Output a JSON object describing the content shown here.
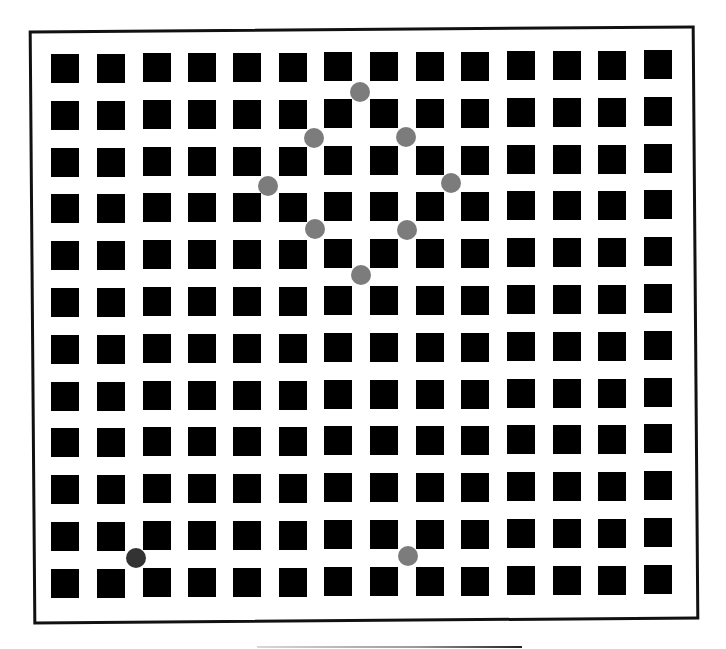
{
  "figure": {
    "grid": {
      "columns": 14,
      "rows": 12,
      "square_color": "#000000",
      "background_color": "#ffffff",
      "col_x": [
        51,
        97,
        143,
        188,
        233,
        279,
        324,
        370,
        416,
        461,
        507,
        553,
        598,
        644
      ],
      "row_y": [
        54,
        101,
        148,
        194,
        241,
        288,
        335,
        382,
        428,
        475,
        522,
        569
      ]
    },
    "frame": {
      "border_color": "#111111"
    },
    "circles": [
      {
        "x": 360,
        "y": 92,
        "color": "#7c7c7c",
        "label": "diamond-top"
      },
      {
        "x": 314,
        "y": 138,
        "color": "#7c7c7c",
        "label": "diamond-upper-left"
      },
      {
        "x": 406,
        "y": 137,
        "color": "#7c7c7c",
        "label": "diamond-upper-right"
      },
      {
        "x": 268,
        "y": 186,
        "color": "#7c7c7c",
        "label": "diamond-left"
      },
      {
        "x": 451,
        "y": 183,
        "color": "#7c7c7c",
        "label": "diamond-right"
      },
      {
        "x": 315,
        "y": 229,
        "color": "#7c7c7c",
        "label": "diamond-lower-left"
      },
      {
        "x": 407,
        "y": 230,
        "color": "#7c7c7c",
        "label": "diamond-lower-right"
      },
      {
        "x": 361,
        "y": 275,
        "color": "#7c7c7c",
        "label": "diamond-bottom"
      },
      {
        "x": 136,
        "y": 558,
        "color": "#333333",
        "label": "dark-reference"
      },
      {
        "x": 408,
        "y": 556,
        "color": "#7c7c7c",
        "label": "gray-reference"
      }
    ]
  }
}
